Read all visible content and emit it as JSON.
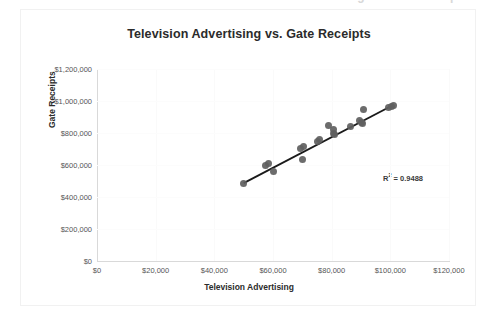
{
  "top_crop": {
    "partial_text": "Television Advertising vs. Gate Receipts"
  },
  "chart": {
    "title": "Television Advertising vs. Gate Receipts",
    "x_axis_title": "Television Advertising",
    "y_axis_title": "Gate Receipts",
    "r_squared_prefix": "R",
    "r_squared_sup": "2",
    "r_squared_value": " = 0.9488",
    "r_squared_text": "R² = 0.9488",
    "colors": {
      "marker": "#5f5f5f",
      "trendline": "#1a1a1a",
      "axis": "#d9d9d9",
      "gridline": "#fafafa",
      "text": "#3b3b3b",
      "background": "#ffffff"
    }
  },
  "chart_data": {
    "type": "scatter",
    "title": "Television Advertising vs. Gate Receipts",
    "xlabel": "Television Advertising",
    "ylabel": "Gate Receipts",
    "xlim": [
      0,
      120000
    ],
    "ylim": [
      0,
      1200000
    ],
    "xtick_labels": [
      "$0",
      "$20,000",
      "$40,000",
      "$60,000",
      "$80,000",
      "$100,000",
      "$120,000"
    ],
    "xticks": [
      0,
      20000,
      40000,
      60000,
      80000,
      100000,
      120000
    ],
    "ytick_labels": [
      "$0",
      "$200,000",
      "$400,000",
      "$600,000",
      "$800,000",
      "$1,000,000",
      "$1,200,000"
    ],
    "yticks": [
      0,
      200000,
      400000,
      600000,
      800000,
      1000000,
      1200000
    ],
    "grid": true,
    "legend": false,
    "annotations": [
      "R² = 0.9488"
    ],
    "r_squared": 0.9488,
    "trendline": {
      "type": "linear",
      "x_start": 50000,
      "y_start": 487000,
      "x_end": 101000,
      "y_end": 975000
    },
    "points": [
      {
        "x": 50000,
        "y": 487000
      },
      {
        "x": 57500,
        "y": 600000
      },
      {
        "x": 58500,
        "y": 612000
      },
      {
        "x": 60000,
        "y": 562000
      },
      {
        "x": 69500,
        "y": 706000
      },
      {
        "x": 70500,
        "y": 718000
      },
      {
        "x": 70000,
        "y": 637000
      },
      {
        "x": 75000,
        "y": 750000
      },
      {
        "x": 76000,
        "y": 762000
      },
      {
        "x": 79000,
        "y": 850000
      },
      {
        "x": 80500,
        "y": 825000
      },
      {
        "x": 80500,
        "y": 800000
      },
      {
        "x": 81000,
        "y": 793000
      },
      {
        "x": 86500,
        "y": 843000
      },
      {
        "x": 89500,
        "y": 880000
      },
      {
        "x": 90000,
        "y": 868000
      },
      {
        "x": 90500,
        "y": 862000
      },
      {
        "x": 91000,
        "y": 945000
      },
      {
        "x": 99500,
        "y": 962000
      },
      {
        "x": 100500,
        "y": 968000
      },
      {
        "x": 101000,
        "y": 972000
      }
    ]
  }
}
